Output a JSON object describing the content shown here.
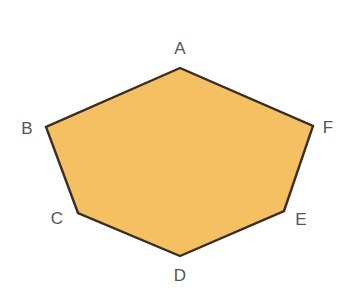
{
  "figure": {
    "type": "polygon-diagram",
    "shape_name": "hexagon",
    "sides": 6,
    "canvas": {
      "width": 349,
      "height": 298,
      "background_color": "#ffffff"
    },
    "style": {
      "fill_color": "#f5c062",
      "stroke_color": "#3a2e22",
      "stroke_width": 2.4,
      "label_color": "#555555",
      "label_font_size": 17
    },
    "vertices": [
      {
        "id": "A",
        "label": "A",
        "x": 180,
        "y": 68,
        "label_x": 180,
        "label_y": 48
      },
      {
        "id": "B",
        "label": "B",
        "x": 46,
        "y": 127,
        "label_x": 27,
        "label_y": 128
      },
      {
        "id": "C",
        "label": "C",
        "x": 78,
        "y": 213,
        "label_x": 57,
        "label_y": 218
      },
      {
        "id": "D",
        "label": "D",
        "x": 180,
        "y": 256,
        "label_x": 180,
        "label_y": 275
      },
      {
        "id": "E",
        "label": "E",
        "x": 284,
        "y": 211,
        "label_x": 301,
        "label_y": 219
      },
      {
        "id": "F",
        "label": "F",
        "x": 313,
        "y": 126,
        "label_x": 328,
        "label_y": 127
      }
    ],
    "edges": [
      {
        "from": "A",
        "to": "B"
      },
      {
        "from": "B",
        "to": "C"
      },
      {
        "from": "C",
        "to": "D"
      },
      {
        "from": "D",
        "to": "E"
      },
      {
        "from": "E",
        "to": "F"
      },
      {
        "from": "F",
        "to": "A"
      }
    ],
    "polygon_points": "180,68 46,127 78,213 180,256 284,211 313,126"
  }
}
